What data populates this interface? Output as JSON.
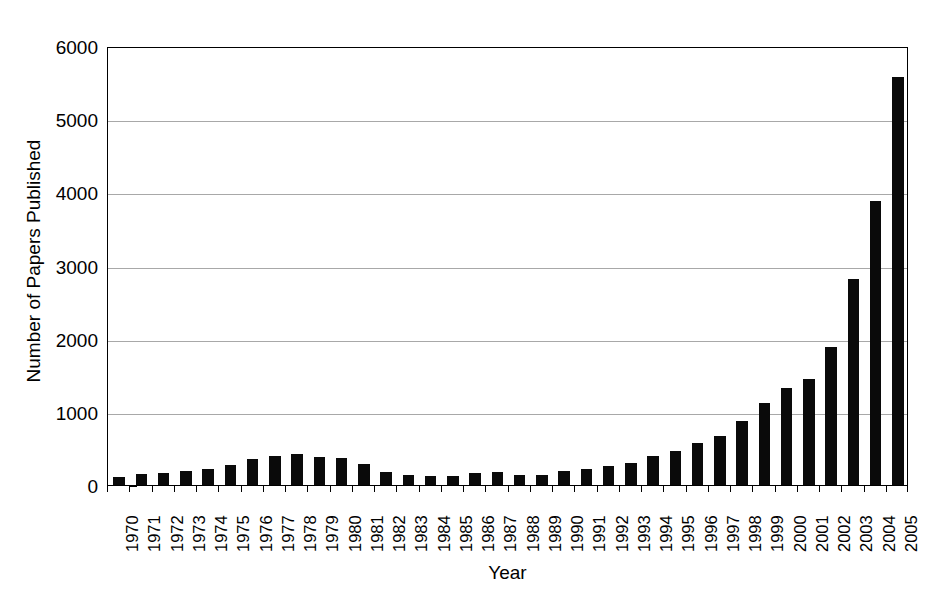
{
  "chart_data": {
    "type": "bar",
    "title": "",
    "xlabel": "Year",
    "ylabel": "Number of Papers Published",
    "ylim": [
      0,
      6000
    ],
    "ytick_labels": [
      "0",
      "1000",
      "2000",
      "3000",
      "4000",
      "5000",
      "6000"
    ],
    "yticks": [
      0,
      1000,
      2000,
      3000,
      4000,
      5000,
      6000
    ],
    "grid": true,
    "grid_axis": "y",
    "legend": false,
    "bar_color": "#0a0a0a",
    "categories": [
      "1970",
      "1971",
      "1972",
      "1973",
      "1974",
      "1975",
      "1976",
      "1977",
      "1978",
      "1979",
      "1980",
      "1981",
      "1982",
      "1983",
      "1984",
      "1985",
      "1986",
      "1987",
      "1988",
      "1989",
      "1990",
      "1991",
      "1992",
      "1993",
      "1994",
      "1995",
      "1996",
      "1997",
      "1998",
      "1999",
      "2000",
      "2001",
      "2002",
      "2003",
      "2004",
      "2005"
    ],
    "values": [
      115,
      150,
      165,
      190,
      215,
      280,
      355,
      390,
      420,
      385,
      370,
      285,
      180,
      140,
      130,
      120,
      160,
      175,
      135,
      140,
      195,
      225,
      265,
      305,
      395,
      470,
      570,
      665,
      880,
      1115,
      1325,
      1445,
      1890,
      2810,
      3875,
      5580
    ]
  },
  "axis": {
    "y_title": "Number of Papers Published",
    "x_title": "Year"
  }
}
